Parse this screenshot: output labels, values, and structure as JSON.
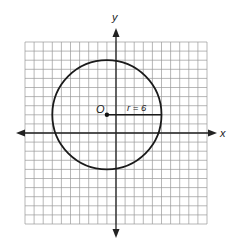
{
  "diagram": {
    "type": "coordinate-plane-circle",
    "axes": {
      "x_label": "x",
      "y_label": "y",
      "x_range": [
        -10,
        10
      ],
      "y_range": [
        -10,
        10
      ],
      "grid_step": 1,
      "arrows": true
    },
    "circle": {
      "center_label": "O",
      "center": [
        -1,
        2
      ],
      "radius": 6,
      "radius_label": "r = 6",
      "radius_direction": "horizontal-right"
    },
    "colors": {
      "grid": "#9a9a9a",
      "axis": "#222222",
      "stroke": "#1a1a1a",
      "background": "#ffffff"
    }
  }
}
